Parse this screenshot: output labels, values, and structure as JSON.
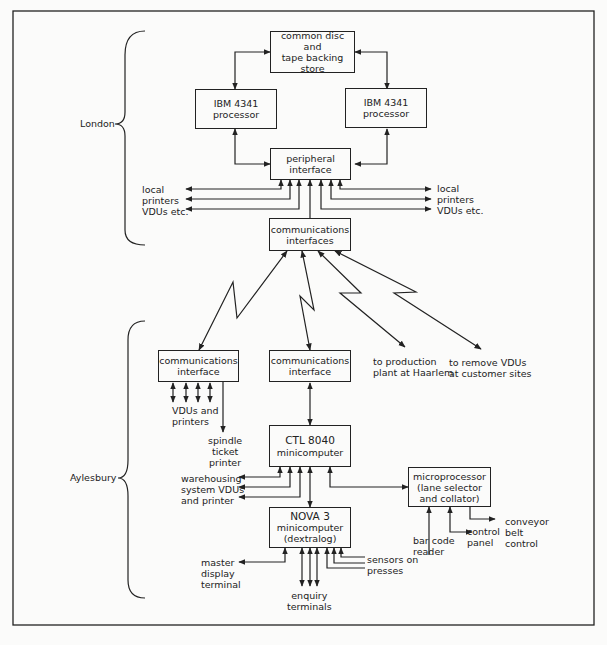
{
  "regions": {
    "london": "London",
    "aylesbury": "Aylesbury"
  },
  "boxes": {
    "backing_store": [
      "common disc and",
      "tape backing store"
    ],
    "ibm_left": [
      "IBM 4341",
      "processor"
    ],
    "ibm_right": [
      "IBM 4341",
      "processor"
    ],
    "peripheral": [
      "peripheral",
      "interface"
    ],
    "comms_london": [
      "communications",
      "interfaces"
    ],
    "comms_a": [
      "communications",
      "interface"
    ],
    "comms_b": [
      "communications",
      "interface"
    ],
    "ctl": [
      "CTL 8040",
      "minicomputer"
    ],
    "nova": [
      "NOVA 3",
      "minicomputer",
      "(dextralog)"
    ],
    "micro": [
      "microprocessor",
      "(lane selector",
      "and collator)"
    ]
  },
  "labels": {
    "local_left": [
      "local",
      "printers",
      "VDUs etc."
    ],
    "local_right": [
      "local",
      "printers",
      "VDUs etc."
    ],
    "haarlem": [
      "to production",
      "plant at Haarlem"
    ],
    "remote_vdus": [
      "to remove VDUs",
      "at customer sites"
    ],
    "vdus_printers": [
      "VDUs and",
      "printers"
    ],
    "spindle": [
      "spindle",
      "ticket",
      "printer"
    ],
    "warehousing": [
      "warehousing",
      "system VDUs",
      "and printer"
    ],
    "barcode": [
      "bar code",
      "reader"
    ],
    "control_panel": [
      "control",
      "panel"
    ],
    "conveyor": [
      "conveyor",
      "belt",
      "control"
    ],
    "sensors": [
      "sensors on",
      "presses"
    ],
    "master": [
      "master",
      "display",
      "terminal"
    ],
    "enquiry": [
      "enquiry",
      "terminals"
    ]
  },
  "colors": {
    "ink": "#222222",
    "paper": "#fbfbfa"
  }
}
